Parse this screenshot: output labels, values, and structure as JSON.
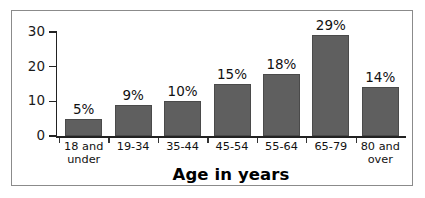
{
  "chart_data": {
    "type": "bar",
    "title": "",
    "xlabel": "Age in years",
    "ylabel": "",
    "categories": [
      "18 and under",
      "19-34",
      "35-44",
      "45-54",
      "55-64",
      "65-79",
      "80 and over"
    ],
    "category_lines": [
      [
        "18 and",
        "under"
      ],
      [
        "19-34"
      ],
      [
        "35-44"
      ],
      [
        "45-54"
      ],
      [
        "55-64"
      ],
      [
        "65-79"
      ],
      [
        "80 and",
        "over"
      ]
    ],
    "values": [
      5,
      9,
      10,
      15,
      18,
      29,
      14
    ],
    "data_labels": [
      "5%",
      "9%",
      "10%",
      "15%",
      "18%",
      "29%",
      "14%"
    ],
    "ylim": [
      0,
      30
    ],
    "y_ticks": [
      0,
      10,
      20,
      30
    ],
    "y_tick_labels": [
      "0",
      "10",
      "20",
      "30"
    ],
    "grid": false,
    "legend": null,
    "bar_color": "#5f5f5f",
    "axis_color": "#222222",
    "frame_color": "#8b8b8b",
    "background": "#ffffff"
  }
}
